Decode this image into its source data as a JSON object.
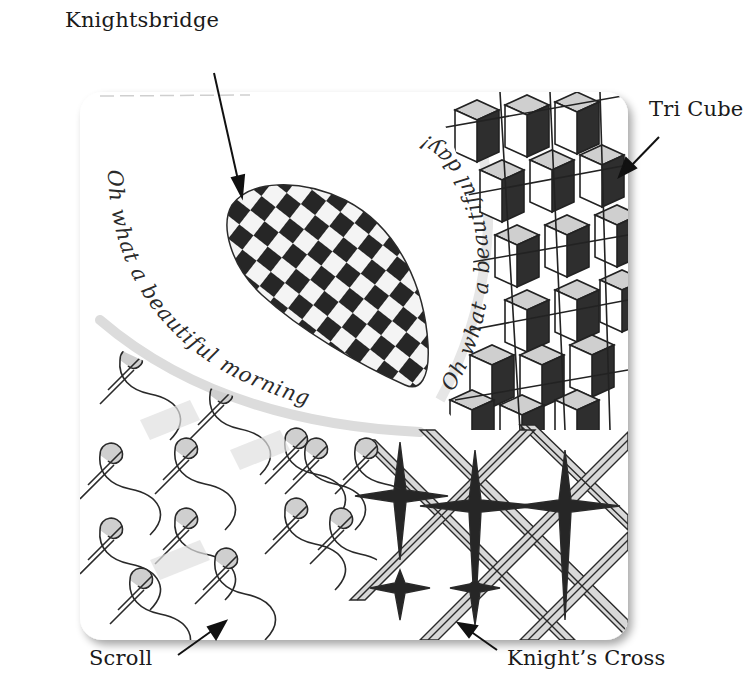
{
  "figure": {
    "tile": {
      "background": "#ffffff",
      "ink_color": "#1f1f1f",
      "shade_color": "#bdbdbd"
    },
    "labels": [
      {
        "id": "knightsbridge",
        "text": "Knightsbridge",
        "points_to": "checkered egg shape, upper-center"
      },
      {
        "id": "tri-cube",
        "text": "Tri Cube",
        "points_to": "cube pattern, upper-right"
      },
      {
        "id": "scroll",
        "text": "Scroll",
        "points_to": "scroll pattern, lower-left"
      },
      {
        "id": "knights-cross",
        "text": "Knight’s Cross",
        "points_to": "crossed bands pattern, lower-right"
      }
    ],
    "handwriting": {
      "left_arc": "Oh what a beautiful morning",
      "right_arc": "Oh what a beautiful day!"
    }
  }
}
